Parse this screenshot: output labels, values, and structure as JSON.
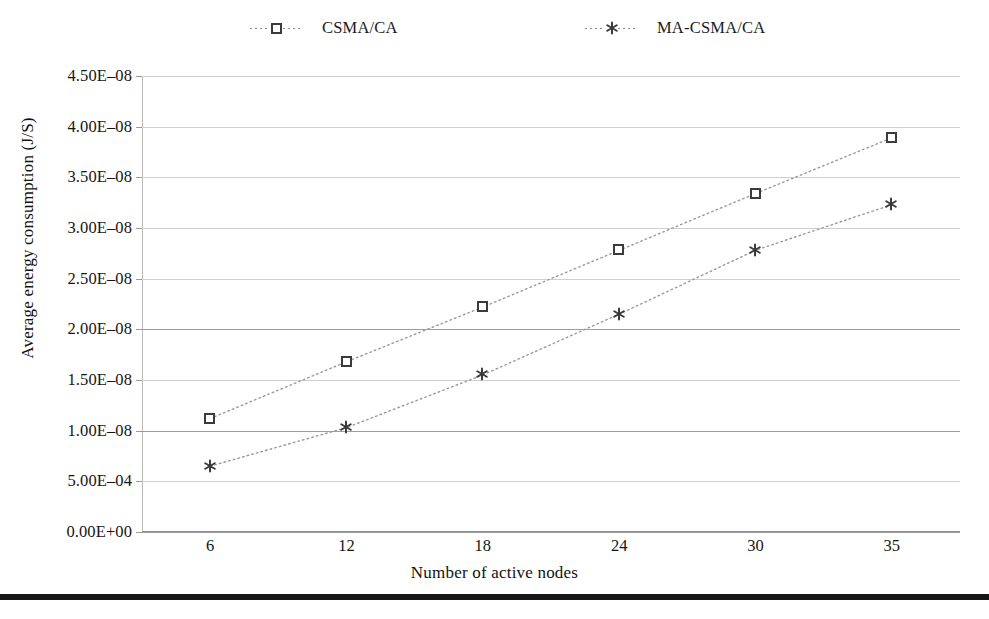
{
  "chart_data": {
    "type": "line",
    "title": "",
    "xlabel": "Number of active nodes",
    "ylabel": "Average energy consumption (J/S)",
    "categories": [
      "6",
      "12",
      "18",
      "24",
      "30",
      "35"
    ],
    "x_values": [
      6,
      12,
      18,
      24,
      30,
      35
    ],
    "ytick_labels": [
      "4.50E–08",
      "4.00E–08",
      "3.50E–08",
      "3.00E–08",
      "2.50E–08",
      "2.00E–08",
      "1.50E–08",
      "1.00E–08",
      "5.00E–04",
      "0.00E+00"
    ],
    "ytick_values": [
      4.5e-08,
      4e-08,
      3.5e-08,
      3e-08,
      2.5e-08,
      2e-08,
      1.5e-08,
      1e-08,
      5e-09,
      0.0
    ],
    "ylim": [
      0,
      4.5e-08
    ],
    "grid": "horizontal",
    "legend_position": "top",
    "series": [
      {
        "name": "CSMA/CA",
        "marker": "open-square",
        "line_style": "dotted",
        "color": "#3b3b3b",
        "values": [
          1.12e-08,
          1.68e-08,
          2.22e-08,
          2.78e-08,
          3.34e-08,
          3.89e-08
        ],
        "value_labels": [
          "1.12E–08",
          "1.68E–08",
          "2.22E–08",
          "2.78E–08",
          "3.34E–08",
          "3.89E–08"
        ]
      },
      {
        "name": "MA-CSMA/CA",
        "marker": "asterisk",
        "line_style": "dotted",
        "color": "#3b3b3b",
        "values": [
          6.5e-09,
          1.03e-08,
          1.55e-08,
          2.15e-08,
          2.78e-08,
          3.23e-08
        ],
        "value_labels": [
          "6.50E–09",
          "1.03E–08",
          "1.55E–08",
          "2.15E–08",
          "2.78E–08",
          "3.23E–08"
        ]
      }
    ]
  },
  "legend": {
    "entries": [
      {
        "label": "CSMA/CA",
        "marker": "open-square"
      },
      {
        "label": "MA-CSMA/CA",
        "marker": "asterisk"
      }
    ]
  },
  "colors": {
    "series_marker": "#3b3b3b",
    "gridline": "#cfcfcf",
    "gridline_major": "#9d9d9d",
    "axis": "#8f8f8f",
    "text": "#151515",
    "bottom_rule": "#171717",
    "background": "#ffffff"
  }
}
